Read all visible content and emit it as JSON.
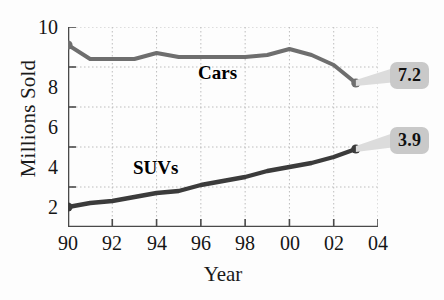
{
  "chart_data": {
    "type": "line",
    "title": "",
    "xlabel": "Year",
    "ylabel": "Millions Sold",
    "x": [
      1990,
      1991,
      1992,
      1993,
      1994,
      1995,
      1996,
      1997,
      1998,
      1999,
      2000,
      2001,
      2002,
      2003
    ],
    "xtick_labels": [
      "90",
      "92",
      "94",
      "96",
      "98",
      "00",
      "02",
      "04"
    ],
    "xtick_values": [
      1990,
      1992,
      1994,
      1996,
      1998,
      2000,
      2002,
      2004
    ],
    "ytick_labels": [
      "2",
      "4",
      "6",
      "8",
      "10"
    ],
    "ytick_values": [
      2,
      4,
      6,
      8,
      10
    ],
    "xlim": [
      1990,
      2004
    ],
    "ylim": [
      0,
      10
    ],
    "grid": true,
    "legend": "inline-labels",
    "series": [
      {
        "name": "Cars",
        "color": "#6e6e6e",
        "values": [
          9.1,
          8.4,
          8.4,
          8.4,
          8.7,
          8.5,
          8.5,
          8.5,
          8.5,
          8.6,
          8.9,
          8.6,
          8.1,
          7.2
        ],
        "end_marker": true,
        "end_label": "7.2"
      },
      {
        "name": "SUVs",
        "color": "#3b3b3b",
        "values": [
          1.0,
          1.2,
          1.3,
          1.5,
          1.7,
          1.8,
          2.1,
          2.3,
          2.5,
          2.8,
          3.0,
          3.2,
          3.5,
          3.9
        ],
        "end_marker": true,
        "end_label": "3.9"
      }
    ],
    "annotations": [
      {
        "text": "Cars",
        "series": "Cars"
      },
      {
        "text": "SUVs",
        "series": "SUVs"
      },
      {
        "text": "7.2",
        "type": "callout",
        "series": "Cars",
        "at_x": 2003,
        "at_y": 7.2
      },
      {
        "text": "3.9",
        "type": "callout",
        "series": "SUVs",
        "at_x": 2003,
        "at_y": 3.9
      }
    ]
  },
  "colors": {
    "cars_line": "#6e6e6e",
    "suvs_line": "#3b3b3b",
    "grid": "#bdbdbd",
    "axis": "#4a4a4a",
    "callout_bg": "#c9c9c9",
    "callout_text": "#111111",
    "background": "#fdfdfd"
  }
}
